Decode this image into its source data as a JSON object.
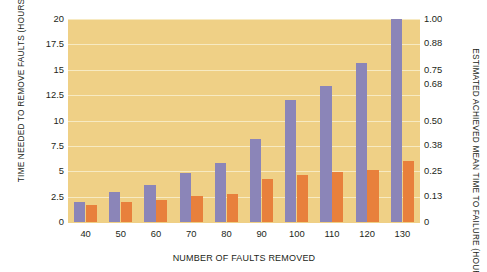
{
  "chart_data": {
    "type": "bar",
    "title": "",
    "xlabel": "NUMBER OF FAULTS REMOVED",
    "ylabel": "TIME NEEDED TO REMOVE FAULTS (HOURS)",
    "y2label": "ESTIMATED ACHIEVED MEAN TIME TO FAILURE (HOURS)",
    "categories": [
      "40",
      "50",
      "60",
      "70",
      "80",
      "90",
      "100",
      "110",
      "120",
      "130"
    ],
    "ylim": [
      0,
      20
    ],
    "y2lim": [
      0,
      1.0
    ],
    "yticks": [
      "0",
      "2.5",
      "5",
      "7.5",
      "10",
      "12.5",
      "15",
      "17.5",
      "20"
    ],
    "ytick_values": [
      0,
      2.5,
      5,
      7.5,
      10,
      12.5,
      15,
      17.5,
      20
    ],
    "y2ticks": [
      "0",
      "0.13",
      "0.25",
      "0.38",
      "0.50",
      "0.68",
      "0.75",
      "0.88",
      "1.00"
    ],
    "y2tick_values": [
      0,
      0.13,
      0.25,
      0.38,
      0.5,
      0.68,
      0.75,
      0.88,
      1.0
    ],
    "grid": true,
    "legend": "none",
    "series": [
      {
        "name": "TIME NEEDED TO REMOVE FAULTS (HOURS)",
        "axis": "left",
        "color": "#8b85b8",
        "values": [
          2.0,
          3.0,
          3.6,
          4.8,
          5.8,
          8.2,
          12.0,
          13.4,
          15.7,
          20.0
        ]
      },
      {
        "name": "ESTIMATED ACHIEVED MEAN TIME TO FAILURE (HOURS)",
        "axis": "right",
        "color": "#e8803c",
        "values": [
          0.085,
          0.1,
          0.11,
          0.13,
          0.14,
          0.21,
          0.23,
          0.245,
          0.255,
          0.3
        ]
      }
    ]
  },
  "colors": {
    "plot_background": "#efd086",
    "gridline": "#f7eac2",
    "series_left": "#8b85b8",
    "series_right": "#e8803c",
    "page_background": "#ffffff",
    "text": "#231f20"
  }
}
